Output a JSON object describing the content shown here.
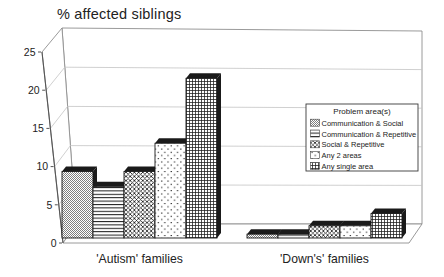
{
  "chart_data": {
    "type": "bar",
    "style": "3d-column",
    "ylabel": "% affected siblings",
    "categories": [
      "'Autism' families",
      "'Down's' families"
    ],
    "series": [
      {
        "name": "Communication & Social",
        "pattern": "dense-dots",
        "values": [
          8.7,
          0.5
        ]
      },
      {
        "name": "Communication & Repetitive",
        "pattern": "horizontal-lines",
        "values": [
          6.7,
          0.5
        ]
      },
      {
        "name": "Social & Repetitive",
        "pattern": "crosshatch",
        "values": [
          8.7,
          1.6
        ]
      },
      {
        "name": "Any 2 areas",
        "pattern": "sparse-dots",
        "values": [
          12.4,
          1.6
        ]
      },
      {
        "name": "Any single area",
        "pattern": "fine-grid",
        "values": [
          20.9,
          3.2
        ]
      }
    ],
    "ylim": [
      0,
      25
    ],
    "yticks": [
      "0",
      "5",
      "10",
      "15",
      "20",
      "25"
    ],
    "grid": true,
    "legend": {
      "title": "Problem area(s)",
      "position": "middle-right"
    },
    "colors": {
      "ink": "#1a1a1a",
      "gridline": "#c4c4c4",
      "wall_stroke": "#8f8f8f",
      "text": "#222222",
      "background": "#ffffff"
    }
  }
}
